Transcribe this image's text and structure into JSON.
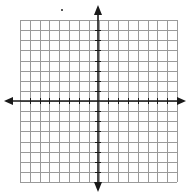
{
  "figure": {
    "type": "coordinate-plane",
    "grid": {
      "columns": 16,
      "rows": 16,
      "left": 20,
      "top": 20,
      "right": 177,
      "bottom": 182,
      "line_color": "#9a9a9a",
      "line_width": 1
    },
    "axes": {
      "x_axis_y": 101,
      "y_axis_x": 98,
      "color": "#1a1a1a",
      "width": 1.6,
      "x_arrow_left_tip": 4,
      "x_arrow_right_tip": 186,
      "y_arrow_top_tip": 5,
      "y_arrow_bottom_tip": 192,
      "tick_length": 3,
      "ticks_per_side": 8,
      "labels": []
    },
    "stray_mark": {
      "x": 61,
      "y": 9
    },
    "background": "#ffffff"
  }
}
